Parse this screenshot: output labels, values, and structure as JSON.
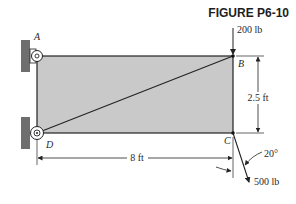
{
  "figure": {
    "title": "FIGURE P6-10"
  },
  "points": {
    "A": "A",
    "B": "B",
    "C": "C",
    "D": "D"
  },
  "loads": {
    "vertical_force": "200 lb",
    "angled_force": "500 lb",
    "angle": "20°"
  },
  "dimensions": {
    "height": "2.5 ft",
    "width": "8 ft"
  },
  "colors": {
    "plate_fill": "#c9c9c9",
    "wall_fill": "#6e6e6e",
    "line": "#222222"
  }
}
